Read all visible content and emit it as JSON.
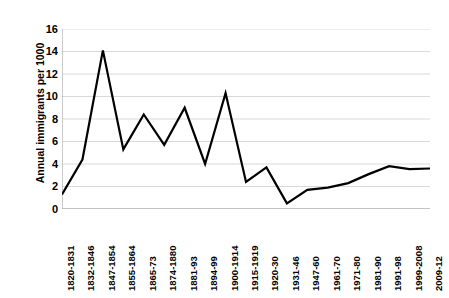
{
  "chart_data": {
    "type": "line",
    "title": "",
    "subtitle": "",
    "xlabel": "",
    "ylabel": "Annual immigrants per 1000",
    "ylim": [
      0,
      16
    ],
    "ytick_step": 2,
    "yticks": [
      "0",
      "2",
      "4",
      "6",
      "8",
      "10",
      "12",
      "14",
      "16"
    ],
    "grid": true,
    "grid_axis": "y",
    "legend": false,
    "legend_position": "none",
    "line_color": "#000000",
    "line_width": 2.2,
    "markers": false,
    "categories": [
      "1820-1831",
      "1832-1846",
      "1847-1854",
      "1855-1864",
      "1865-73",
      "1874-1880",
      "1881-93",
      "1894-99",
      "1900-1914",
      "1915-1919",
      "1920-30",
      "1931-46",
      "1947-60",
      "1961-70",
      "1971-80",
      "1981-90",
      "1991-98",
      "1999-2008",
      "2009-12"
    ],
    "values": [
      1.3,
      4.4,
      14.1,
      5.3,
      8.4,
      5.7,
      9.0,
      4.0,
      10.3,
      2.4,
      3.7,
      0.5,
      1.7,
      1.9,
      2.3,
      3.1,
      3.8,
      3.55,
      3.6
    ],
    "series": [
      {
        "name": "Annual immigrants per 1000",
        "values": [
          1.3,
          4.4,
          14.1,
          5.3,
          8.4,
          5.7,
          9.0,
          4.0,
          10.3,
          2.4,
          3.7,
          0.5,
          1.7,
          1.9,
          2.3,
          3.1,
          3.8,
          3.55,
          3.6
        ]
      }
    ]
  }
}
